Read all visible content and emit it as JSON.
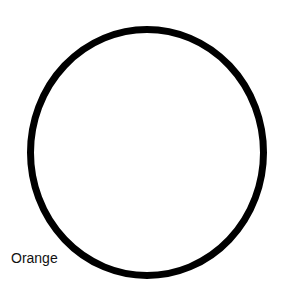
{
  "diagram": {
    "shape": {
      "type": "circle",
      "stroke_color": "#000000",
      "fill_color": "#ffffff"
    },
    "label": "Orange"
  }
}
